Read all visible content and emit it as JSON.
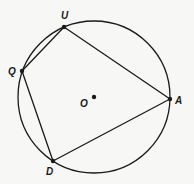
{
  "diagram": {
    "type": "inscribed-quadrilateral",
    "circle": {
      "center_label": "O",
      "cx": 94,
      "cy": 97,
      "r": 76
    },
    "points": [
      {
        "label": "U",
        "x": 64,
        "y": 27,
        "label_x": 61,
        "label_y": 19
      },
      {
        "label": "A",
        "x": 170,
        "y": 99,
        "label_x": 175,
        "label_y": 104
      },
      {
        "label": "D",
        "x": 53,
        "y": 161,
        "label_x": 46,
        "label_y": 175
      },
      {
        "label": "Q",
        "x": 22,
        "y": 71,
        "label_x": 8,
        "label_y": 75
      }
    ],
    "center": {
      "label": "O",
      "x": 94,
      "y": 97,
      "label_x": 80,
      "label_y": 107
    },
    "polygon_order": [
      "U",
      "A",
      "D",
      "Q"
    ],
    "stroke_color": "#1a1a1a",
    "background_color": "#f7f7f5"
  }
}
